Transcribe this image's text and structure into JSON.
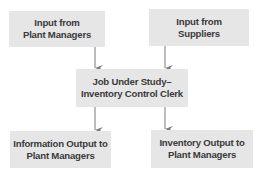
{
  "diagram": {
    "type": "flowchart",
    "colors": {
      "box_fill": "#e6e6e6",
      "text": "#3a3a3a",
      "arrow": "#7a7a7a"
    },
    "nodes": {
      "input_plant_managers": {
        "label": "Input from\nPlant Managers"
      },
      "input_suppliers": {
        "label": "Input from\nSuppliers"
      },
      "job_under_study": {
        "label": "Job Under Study–\nInventory Control Clerk"
      },
      "info_output": {
        "label": "Information Output to\nPlant Managers"
      },
      "inventory_output": {
        "label": "Inventory Output to\nPlant Managers"
      }
    },
    "edges": [
      {
        "from": "input_plant_managers",
        "to": "job_under_study"
      },
      {
        "from": "input_suppliers",
        "to": "job_under_study"
      },
      {
        "from": "job_under_study",
        "to": "info_output"
      },
      {
        "from": "job_under_study",
        "to": "inventory_output"
      }
    ]
  }
}
